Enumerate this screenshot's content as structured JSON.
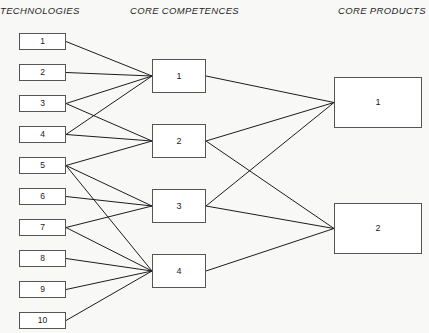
{
  "headers": {
    "technologies": "TECHNOLOGIES",
    "competences": "CORE COMPETENCES",
    "products": "CORE PRODUCTS"
  },
  "colors": {
    "background": "#f8f8f6",
    "box_fill": "#ffffff",
    "box_border": "#555555",
    "edge": "#1c1c1c",
    "text": "#1a1a1a"
  },
  "technologies": [
    {
      "label": "1",
      "x": 19,
      "y": 33,
      "w": 47,
      "h": 17
    },
    {
      "label": "2",
      "x": 19,
      "y": 64,
      "w": 47,
      "h": 17
    },
    {
      "label": "3",
      "x": 19,
      "y": 95,
      "w": 47,
      "h": 17
    },
    {
      "label": "4",
      "x": 19,
      "y": 126,
      "w": 47,
      "h": 17
    },
    {
      "label": "5",
      "x": 19,
      "y": 157,
      "w": 47,
      "h": 17
    },
    {
      "label": "6",
      "x": 19,
      "y": 188,
      "w": 47,
      "h": 17
    },
    {
      "label": "7",
      "x": 19,
      "y": 219,
      "w": 47,
      "h": 17
    },
    {
      "label": "8",
      "x": 19,
      "y": 250,
      "w": 47,
      "h": 17
    },
    {
      "label": "9",
      "x": 19,
      "y": 281,
      "w": 47,
      "h": 17
    },
    {
      "label": "10",
      "x": 19,
      "y": 312,
      "w": 47,
      "h": 17
    }
  ],
  "competences": [
    {
      "label": "1",
      "x": 152,
      "y": 59,
      "w": 54,
      "h": 34
    },
    {
      "label": "2",
      "x": 152,
      "y": 124,
      "w": 54,
      "h": 34
    },
    {
      "label": "3",
      "x": 152,
      "y": 189,
      "w": 54,
      "h": 34
    },
    {
      "label": "4",
      "x": 152,
      "y": 254,
      "w": 54,
      "h": 34
    }
  ],
  "products": [
    {
      "label": "1",
      "x": 334,
      "y": 77,
      "w": 88,
      "h": 51
    },
    {
      "label": "2",
      "x": 334,
      "y": 203,
      "w": 88,
      "h": 51
    }
  ],
  "links_tech_to_competence": [
    {
      "from": "1",
      "to": "1"
    },
    {
      "from": "2",
      "to": "1"
    },
    {
      "from": "3",
      "to": "1"
    },
    {
      "from": "3",
      "to": "2"
    },
    {
      "from": "4",
      "to": "1"
    },
    {
      "from": "4",
      "to": "2"
    },
    {
      "from": "5",
      "to": "2"
    },
    {
      "from": "5",
      "to": "3"
    },
    {
      "from": "5",
      "to": "4"
    },
    {
      "from": "6",
      "to": "3"
    },
    {
      "from": "7",
      "to": "3"
    },
    {
      "from": "7",
      "to": "4"
    },
    {
      "from": "8",
      "to": "4"
    },
    {
      "from": "9",
      "to": "4"
    },
    {
      "from": "10",
      "to": "4"
    }
  ],
  "links_competence_to_product": [
    {
      "from": "1",
      "to": "1"
    },
    {
      "from": "2",
      "to": "1"
    },
    {
      "from": "2",
      "to": "2"
    },
    {
      "from": "3",
      "to": "1"
    },
    {
      "from": "3",
      "to": "2"
    },
    {
      "from": "4",
      "to": "2"
    }
  ]
}
